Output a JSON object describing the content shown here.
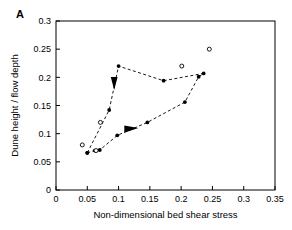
{
  "figure": {
    "panel_label": "A",
    "background_color": "#ffffff",
    "foreground_color": "#000000"
  },
  "chart_data": {
    "type": "scatter",
    "title": "",
    "subtitle": "",
    "xlabel": "Non-dimensional bed shear stress",
    "ylabel": "Dune height / flow depth",
    "xlim": [
      0,
      0.35
    ],
    "ylim": [
      0,
      0.3
    ],
    "xticks": [
      0,
      0.05,
      0.1,
      0.15,
      0.2,
      0.25,
      0.3,
      0.35
    ],
    "xtick_labels": [
      "0",
      "0.05",
      "0.1",
      "0.15",
      "0.2",
      "0.25",
      "0.3",
      "0.35"
    ],
    "yticks": [
      0,
      0.05,
      0.1,
      0.15,
      0.2,
      0.25,
      0.3
    ],
    "ytick_labels": [
      "0",
      "0.05",
      "0.1",
      "0.15",
      "0.2",
      "0.25",
      "0.3"
    ],
    "grid": false,
    "legend": null,
    "legend_position": "none",
    "series": [
      {
        "name": "Hysteresis loop (filled markers, dashed path)",
        "marker": "filled-circle",
        "marker_color": "#000000",
        "line_style": "dashed",
        "line_color": "#000000",
        "points": [
          {
            "x": 0.05,
            "y": 0.066
          },
          {
            "x": 0.062,
            "y": 0.07
          },
          {
            "x": 0.07,
            "y": 0.071
          },
          {
            "x": 0.098,
            "y": 0.097
          },
          {
            "x": 0.146,
            "y": 0.12
          },
          {
            "x": 0.206,
            "y": 0.156
          },
          {
            "x": 0.228,
            "y": 0.201
          },
          {
            "x": 0.236,
            "y": 0.207
          },
          {
            "x": 0.172,
            "y": 0.194
          },
          {
            "x": 0.1,
            "y": 0.22
          },
          {
            "x": 0.085,
            "y": 0.142
          },
          {
            "x": 0.05,
            "y": 0.066
          }
        ]
      },
      {
        "name": "Open circle observations",
        "marker": "open-circle",
        "marker_color": "#000000",
        "line_style": "none",
        "points": [
          {
            "x": 0.042,
            "y": 0.08
          },
          {
            "x": 0.064,
            "y": 0.07
          },
          {
            "x": 0.071,
            "y": 0.12
          },
          {
            "x": 0.201,
            "y": 0.22
          },
          {
            "x": 0.245,
            "y": 0.25
          }
        ]
      }
    ],
    "annotations": [
      {
        "name": "arrow-descending-left-branch",
        "type": "arrowhead",
        "x": 0.093,
        "y": 0.188,
        "direction": "down"
      },
      {
        "name": "arrow-ascending-lower-branch",
        "type": "arrowhead",
        "x": 0.122,
        "y": 0.108,
        "direction": "right"
      }
    ]
  }
}
